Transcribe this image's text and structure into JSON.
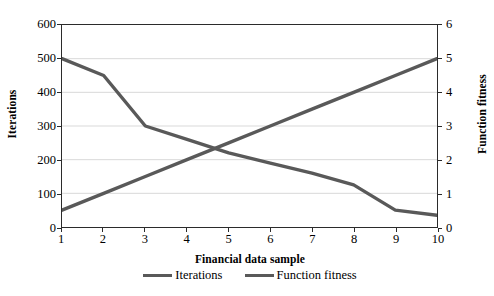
{
  "chart_data": {
    "type": "line",
    "title": "",
    "xlabel": "Financial data sample",
    "ylabel": "Iterations",
    "y2label": "Function fitness",
    "x": [
      1,
      2,
      3,
      4,
      5,
      6,
      7,
      8,
      9,
      10
    ],
    "xlim": [
      1,
      10
    ],
    "ylim": [
      0,
      600
    ],
    "y2lim": [
      0,
      6
    ],
    "grid": true,
    "legend_position": "bottom",
    "series": [
      {
        "name": "Iterations",
        "axis": "left",
        "color": "#595959",
        "values": [
          50,
          100,
          150,
          200,
          250,
          300,
          350,
          400,
          450,
          500
        ]
      },
      {
        "name": "Function fitness",
        "axis": "right",
        "color": "#595959",
        "values": [
          5.0,
          4.5,
          3.0,
          2.6,
          2.2,
          1.9,
          1.6,
          1.25,
          0.5,
          0.35
        ]
      }
    ],
    "y_ticks_left": [
      "0",
      "100",
      "200",
      "300",
      "400",
      "500",
      "600"
    ],
    "y_ticks_right": [
      "0",
      "1",
      "2",
      "3",
      "4",
      "5",
      "6"
    ],
    "x_ticks": [
      "1",
      "2",
      "3",
      "4",
      "5",
      "6",
      "7",
      "8",
      "9",
      "10"
    ]
  },
  "axes": {
    "left_title": "Iterations",
    "right_title": "Function fitness",
    "bottom_title": "Financial data sample"
  },
  "legend": {
    "items": [
      {
        "label": "Iterations"
      },
      {
        "label": "Function fitness"
      }
    ]
  },
  "style": {
    "line_color": "#595959",
    "axis_color": "#2b2b2b",
    "grid_color": "#d9d9d9",
    "background": "#ffffff"
  }
}
